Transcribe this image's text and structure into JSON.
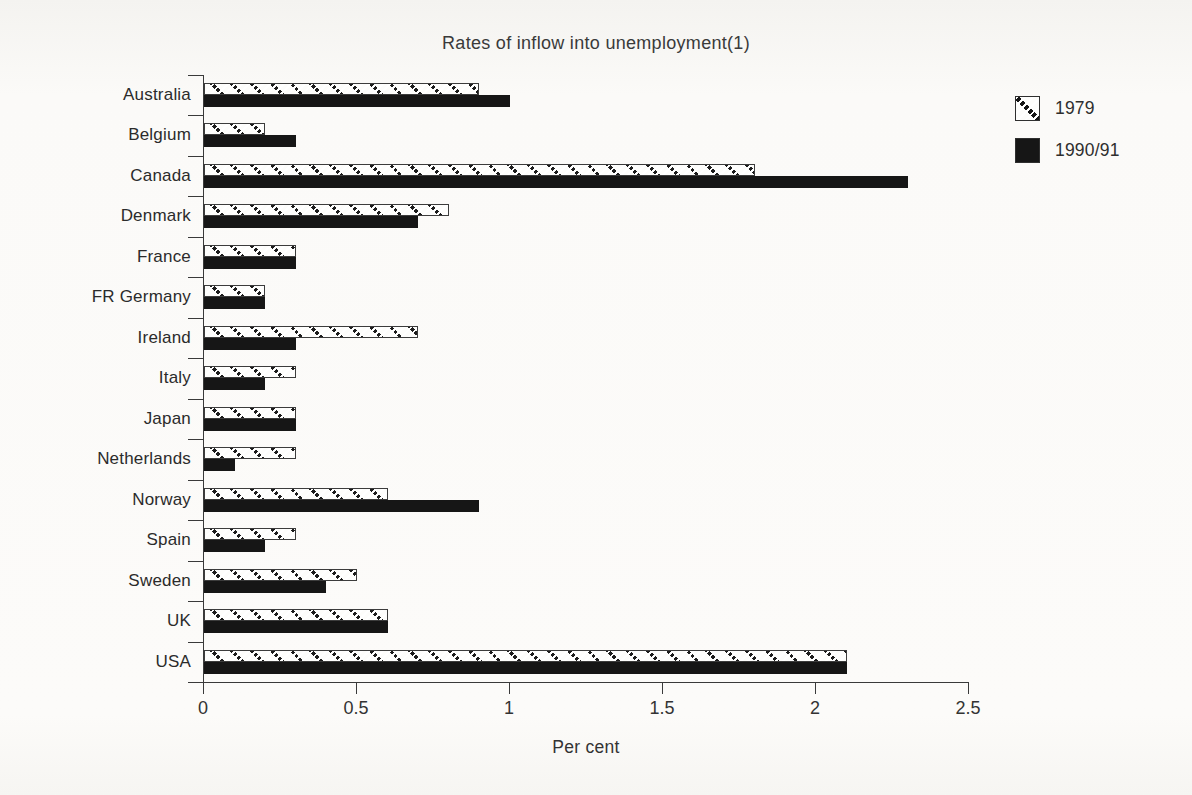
{
  "chart_data": {
    "type": "bar",
    "orientation": "horizontal",
    "title": "Rates of inflow into unemployment(1)",
    "xlabel": "Per cent",
    "categories": [
      "Australia",
      "Belgium",
      "Canada",
      "Denmark",
      "France",
      "FR Germany",
      "Ireland",
      "Italy",
      "Japan",
      "Netherlands",
      "Norway",
      "Spain",
      "Sweden",
      "UK",
      "USA"
    ],
    "series": [
      {
        "name": "1979",
        "style": "hatched",
        "values": [
          0.9,
          0.2,
          1.8,
          0.8,
          0.3,
          0.2,
          0.7,
          0.3,
          0.3,
          0.3,
          0.6,
          0.3,
          0.5,
          0.6,
          2.1
        ]
      },
      {
        "name": "1990/91",
        "style": "solid",
        "values": [
          1.0,
          0.3,
          2.3,
          0.7,
          0.3,
          0.2,
          0.3,
          0.2,
          0.3,
          0.1,
          0.9,
          0.2,
          0.4,
          0.6,
          2.1
        ]
      }
    ],
    "xlim": [
      0,
      2.5
    ],
    "xticks": [
      "0",
      "0.5",
      "1",
      "1.5",
      "2",
      "2.5"
    ],
    "xtick_values": [
      0,
      0.5,
      1,
      1.5,
      2,
      2.5
    ],
    "grid": false,
    "legend_position": "top-right"
  },
  "colors": {
    "bar_solid": "#161616",
    "bar_hatch_stroke": "#1c1c1c",
    "ink": "#2e2e2e",
    "background": "#f8f7f4"
  }
}
